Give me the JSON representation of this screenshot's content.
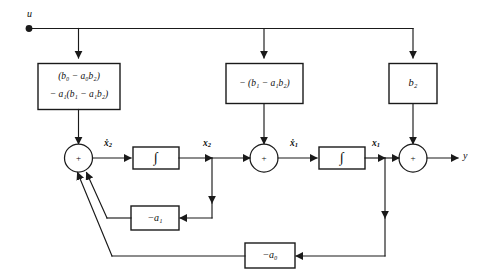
{
  "diagram": {
    "input_label": "u",
    "output_label": "y",
    "blocks": [
      {
        "id": "feedforward-b0",
        "line1": "(b₀ − a₀b₂)",
        "line2": "− a₁(b₁ − a₁b₂)"
      },
      {
        "id": "feedforward-b1",
        "line1": "− (b₁ − a₁b₂)"
      },
      {
        "id": "feedforward-b2",
        "line1": "b₂"
      },
      {
        "id": "feedback-a1",
        "line1": "−a₁"
      },
      {
        "id": "feedback-a0",
        "line1": "−a₀"
      }
    ],
    "integrators": [
      {
        "id": "integrator-2",
        "glyph": "∫"
      },
      {
        "id": "integrator-1",
        "glyph": "∫"
      }
    ],
    "summers": [
      {
        "id": "summer-2",
        "sign": "+"
      },
      {
        "id": "summer-1",
        "sign": "+"
      },
      {
        "id": "summer-out",
        "sign": "+"
      }
    ],
    "signals": [
      {
        "id": "xdot2",
        "html": "ẋ<sub>2</sub>",
        "text": "ẋ2"
      },
      {
        "id": "x2",
        "html": "x<sub>2</sub>",
        "text": "x2"
      },
      {
        "id": "xdot1",
        "html": "ẋ<sub>1</sub>",
        "text": "ẋ1"
      },
      {
        "id": "x1",
        "html": "x<sub>1</sub>",
        "text": "x1"
      }
    ],
    "colors": {
      "line": "#1a1a1a",
      "text": "#0d0d0d",
      "background": "#ffffff"
    }
  }
}
